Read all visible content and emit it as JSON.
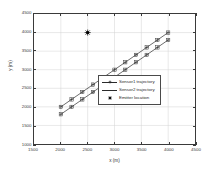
{
  "chart_data": {
    "type": "scatter",
    "title": "",
    "xlabel": "x (m)",
    "ylabel": "y (m)",
    "xlim": [
      1500,
      4500
    ],
    "ylim": [
      1000,
      4500
    ],
    "xticks": [
      1500,
      2000,
      2500,
      3000,
      3500,
      4000,
      4500
    ],
    "yticks": [
      1000,
      1500,
      2000,
      2500,
      3000,
      3500,
      4000,
      4500
    ],
    "xtick_labels": [
      "1500",
      "2000",
      "2500",
      "3000",
      "3500",
      "4000",
      "4500"
    ],
    "ytick_labels": [
      "1000",
      "1500",
      "2000",
      "2500",
      "3000",
      "3500",
      "4000",
      "4500"
    ],
    "grid": true,
    "legend_position": "lower right",
    "series": [
      {
        "name": "Sensor1 trajectory",
        "kind": "line-marker",
        "marker": "cross-square",
        "color": "#2a2a2a",
        "x": [
          2000,
          2200,
          2400,
          2600,
          2800,
          3000,
          3200,
          3400,
          3600,
          3800,
          4000
        ],
        "y": [
          2000,
          2200,
          2400,
          2600,
          2800,
          3000,
          3200,
          3400,
          3600,
          3800,
          4000
        ]
      },
      {
        "name": "Sensor2 trajectory",
        "kind": "line-marker",
        "marker": "cross-square",
        "color": "#2a2a2a",
        "x": [
          2000,
          2200,
          2400,
          2600,
          2800,
          3000,
          3200,
          3400,
          3600,
          3800,
          4000
        ],
        "y": [
          1800,
          2000,
          2200,
          2400,
          2600,
          2800,
          3000,
          3200,
          3400,
          3600,
          3800
        ]
      },
      {
        "name": "Emitter location",
        "kind": "marker-only",
        "marker": "filled-circle",
        "color": "#000000",
        "x": [
          2500
        ],
        "y": [
          4000
        ]
      }
    ]
  },
  "legend": {
    "entries": [
      {
        "label": "Sensor1 trajectory"
      },
      {
        "label": "Sensor2 trajectory"
      },
      {
        "label": "Emitter location"
      }
    ]
  }
}
